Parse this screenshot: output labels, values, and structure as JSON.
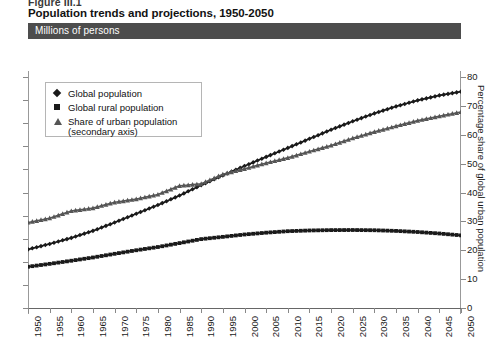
{
  "figure": {
    "label": "Figure III.1",
    "title": "Population trends and projections, 1950-2050",
    "units_banner": "Millions of persons"
  },
  "legend": {
    "items": [
      {
        "label": "Global population",
        "marker": "diamond-marker",
        "sub": ""
      },
      {
        "label": "Global rural population",
        "marker": "square-marker",
        "sub": ""
      },
      {
        "label": "Share of urban population",
        "marker": "triangle-marker",
        "sub": "(secondary axis)"
      }
    ]
  },
  "axes": {
    "left_label": "",
    "left_ticks": [
      "10,000",
      "9,000",
      "8,000",
      "7,000",
      "6,000",
      "5,000",
      "4,000",
      "3,000",
      "2,000",
      "1,000",
      "0"
    ],
    "right_label": "Percentage share of global urban population",
    "right_ticks": [
      "80",
      "70",
      "60",
      "50",
      "40",
      "30",
      "20",
      "10",
      "0"
    ],
    "x_ticks": [
      "1950",
      "1955",
      "1960",
      "1965",
      "1970",
      "1975",
      "1980",
      "1985",
      "1990",
      "1995",
      "2000",
      "2005",
      "2010",
      "2015",
      "2020",
      "2025",
      "2030",
      "2035",
      "2040",
      "2045",
      "2050"
    ]
  },
  "colors": {
    "banner": "#4d4d4d",
    "series_population": "#1a1a1a",
    "series_rural": "#1a1a1a",
    "series_urban_share": "#555555",
    "axis": "#888888"
  },
  "chart_data": {
    "type": "line",
    "title": "Population trends and projections, 1950-2050",
    "subtitle": "Millions of persons",
    "xlabel": "",
    "ylabel": "Millions of persons",
    "ylabel_secondary": "Percentage share of global urban population",
    "ylim": [
      0,
      10000
    ],
    "ylim_secondary": [
      0,
      80
    ],
    "xlim": [
      1950,
      2050
    ],
    "grid": false,
    "legend_position": "upper-left-inside",
    "x": [
      1950,
      1955,
      1960,
      1965,
      1970,
      1975,
      1980,
      1985,
      1990,
      1995,
      2000,
      2005,
      2010,
      2015,
      2020,
      2025,
      2030,
      2035,
      2040,
      2045,
      2050
    ],
    "series": [
      {
        "name": "Global population",
        "axis": "primary",
        "marker": "diamond",
        "values": [
          2536,
          2773,
          3035,
          3340,
          3700,
          4079,
          4458,
          4871,
          5321,
          5742,
          6145,
          6542,
          6930,
          7324,
          7717,
          8084,
          8425,
          8728,
          8989,
          9203,
          9367
        ]
      },
      {
        "name": "Global rural population",
        "axis": "primary",
        "marker": "square",
        "values": [
          1786,
          1911,
          2046,
          2187,
          2346,
          2500,
          2640,
          2810,
          2982,
          3080,
          3182,
          3261,
          3325,
          3356,
          3372,
          3376,
          3366,
          3337,
          3290,
          3225,
          3144
        ]
      },
      {
        "name": "Share of urban population (secondary axis)",
        "axis": "secondary",
        "marker": "triangle",
        "values": [
          29.6,
          31.1,
          33.6,
          34.6,
          36.6,
          37.7,
          39.3,
          42.3,
          43.0,
          46.3,
          48.2,
          50.2,
          52.0,
          54.2,
          56.3,
          58.8,
          61.0,
          63.0,
          64.9,
          66.4,
          67.9
        ]
      }
    ]
  }
}
